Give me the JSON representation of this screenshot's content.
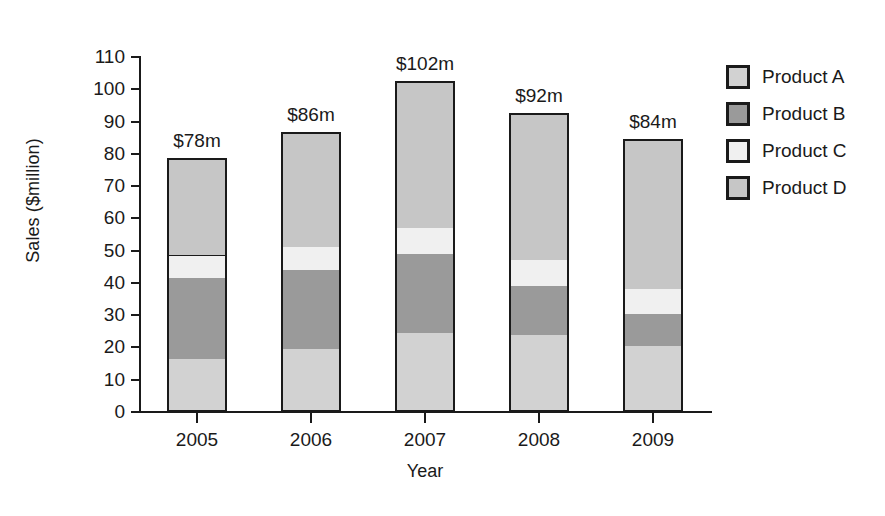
{
  "chart_data": {
    "type": "bar",
    "stacked": true,
    "title": "",
    "xlabel": "Year",
    "ylabel": "Sales ($million)",
    "categories": [
      "2005",
      "2006",
      "2007",
      "2008",
      "2009"
    ],
    "ylim": [
      0,
      110
    ],
    "ytick_step": 10,
    "yticks": [
      "110",
      "100",
      "90",
      "80",
      "70",
      "60",
      "50",
      "40",
      "30",
      "20",
      "10",
      "0"
    ],
    "grid": false,
    "legend_position": "right",
    "series": [
      {
        "name": "Product A",
        "color": "#d2d2d2",
        "values": [
          16.5,
          19.5,
          24.5,
          24,
          20.5
        ]
      },
      {
        "name": "Product B",
        "color": "#9a9a9a",
        "values": [
          25,
          24.5,
          24.5,
          15,
          10
        ]
      },
      {
        "name": "Product C",
        "color": "#f0f0f0",
        "values": [
          7,
          7,
          8,
          8,
          7.5
        ]
      },
      {
        "name": "Product D",
        "color": "#c6c6c6",
        "values": [
          29.5,
          35,
          45,
          45,
          46
        ]
      }
    ],
    "totals": [
      78,
      86,
      102,
      92,
      84
    ],
    "total_labels": [
      "$78m",
      "$86m",
      "$102m",
      "$92m",
      "$84m"
    ],
    "annotations": []
  },
  "legend": {
    "items": [
      {
        "label": "Product A",
        "color": "#d2d2d2"
      },
      {
        "label": "Product B",
        "color": "#9a9a9a"
      },
      {
        "label": "Product C",
        "color": "#f0f0f0"
      },
      {
        "label": "Product D",
        "color": "#c6c6c6"
      }
    ]
  }
}
